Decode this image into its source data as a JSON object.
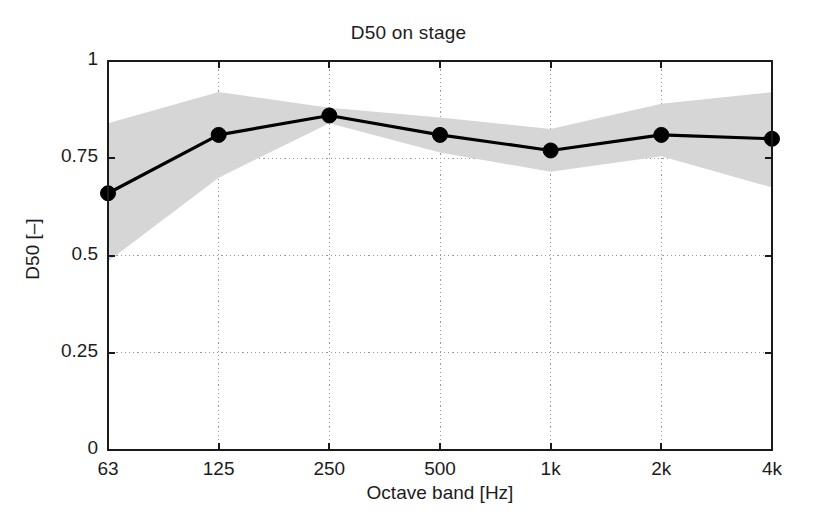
{
  "chart_data": {
    "type": "line",
    "title": "D50 on stage",
    "xlabel": "Octave band [Hz]",
    "ylabel": "D50 [–]",
    "categories": [
      "63",
      "125",
      "250",
      "500",
      "1k",
      "2k",
      "4k"
    ],
    "xtick_labels": [
      "63",
      "125",
      "250",
      "500",
      "1k",
      "2k",
      "4k"
    ],
    "ytick_labels": [
      "0",
      "0.25",
      "0.5",
      "0.75",
      "1"
    ],
    "ytick_values": [
      0,
      0.25,
      0.5,
      0.75,
      1
    ],
    "ylim": [
      0,
      1
    ],
    "grid": true,
    "grid_style": "dotted",
    "legend": null,
    "series": [
      {
        "name": "D50 mean",
        "marker": "filled-circle",
        "color": "#000000",
        "values": [
          0.66,
          0.81,
          0.86,
          0.81,
          0.77,
          0.81,
          0.8
        ]
      }
    ],
    "band": {
      "name": "standard deviation",
      "color": "#d6d6d6",
      "upper": [
        0.84,
        0.92,
        0.88,
        0.855,
        0.825,
        0.89,
        0.92
      ],
      "lower": [
        0.485,
        0.7,
        0.84,
        0.765,
        0.715,
        0.755,
        0.675
      ]
    },
    "axis_color": "#1a1a1a"
  }
}
